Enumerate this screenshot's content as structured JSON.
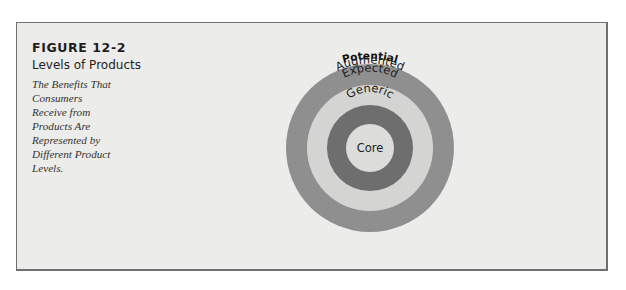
{
  "figure": {
    "number": "FIGURE 12-2",
    "title": "Levels of Products",
    "description": "The Benefits That Consumers Receive from Products Are Represented by Different Product Levels."
  },
  "diagram": {
    "type": "concentric-circles",
    "levels": [
      {
        "label": "Potential",
        "position": "outside-top",
        "color": null
      },
      {
        "label": "Augmented",
        "color": "#8f8f8f"
      },
      {
        "label": "Expected",
        "color": "#d4d4d2"
      },
      {
        "label": "Generic",
        "color": "#6e6e6e"
      },
      {
        "label": "Core",
        "color": "#dcdcda"
      }
    ],
    "background_color": "#ececea",
    "border_color": "#6f6f6f"
  }
}
